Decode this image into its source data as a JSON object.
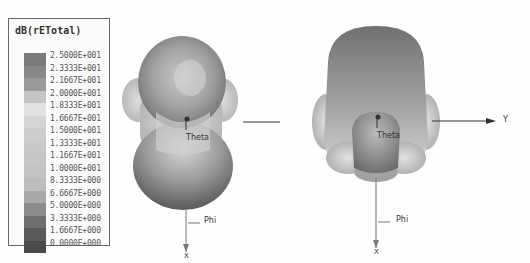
{
  "legend": {
    "title": "dB(rETotal)",
    "ticks": [
      "2.5000E+001",
      "2.3333E+001",
      "2.1667E+001",
      "2.0000E+001",
      "1.8333E+001",
      "1.6667E+001",
      "1.5000E+001",
      "1.3333E+001",
      "1.1667E+001",
      "1.0000E+001",
      "8.3333E+000",
      "6.6667E+000",
      "5.0000E+000",
      "3.3333E+000",
      "1.6667E+000",
      "0.0000E+000"
    ],
    "colors": [
      "#7a7a7a",
      "#888888",
      "#9a9a9a",
      "#c4c4c4",
      "#e2e2e2",
      "#d4d4d4",
      "#cdcdcd",
      "#c9c9c9",
      "#c6c6c6",
      "#c3c3c3",
      "#bdbdbd",
      "#a9a9a9",
      "#8c8c8c",
      "#6f6f6f",
      "#5a5a5a",
      "#4a4a4a"
    ]
  },
  "plots": [
    {
      "view": "left",
      "labels": {
        "theta": "Theta",
        "phi": "Phi",
        "x_axis": "X"
      }
    },
    {
      "view": "right",
      "labels": {
        "theta": "Theta",
        "phi": "Phi",
        "x_axis": "X",
        "y_axis": "Y"
      }
    }
  ],
  "chart_data": {
    "type": "heatmap",
    "quantity": "dB(rETotal)",
    "colorbar": {
      "min": 0.0,
      "max": 25.0,
      "levels": [
        25.0,
        23.333,
        21.667,
        20.0,
        18.333,
        16.667,
        15.0,
        13.333,
        11.667,
        10.0,
        8.3333,
        6.6667,
        5.0,
        3.3333,
        1.6667,
        0.0
      ]
    },
    "views": [
      {
        "name": "view-1",
        "axes_shown": [
          "Theta",
          "Phi",
          "X"
        ]
      },
      {
        "name": "view-2",
        "axes_shown": [
          "Theta",
          "Phi",
          "X",
          "Y"
        ]
      }
    ]
  }
}
